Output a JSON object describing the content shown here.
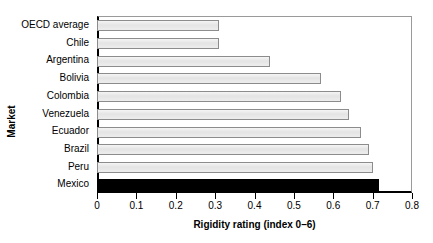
{
  "chart_data": {
    "type": "bar",
    "orientation": "horizontal",
    "title": "",
    "xlabel": "Rigidity rating (index 0–6)",
    "ylabel": "Market",
    "categories": [
      "OECD average",
      "Chile",
      "Argentina",
      "Bolivia",
      "Colombia",
      "Venezuela",
      "Ecuador",
      "Brazil",
      "Peru",
      "Mexico"
    ],
    "values": [
      0.31,
      0.31,
      0.44,
      0.57,
      0.62,
      0.64,
      0.67,
      0.69,
      0.7,
      0.715
    ],
    "xlim": [
      0,
      0.8
    ],
    "xticks": [
      0,
      0.1,
      0.2,
      0.3,
      0.4,
      0.5,
      0.6,
      0.7,
      0.8
    ],
    "xtick_labels": [
      "0",
      "0.1",
      "0.2",
      "0.3",
      "0.4",
      "0.5",
      "0.6",
      "0.7",
      "0.8"
    ],
    "grid": false,
    "legend": false,
    "highlight_category": "Mexico",
    "colors": {
      "bar_fill": "#e8e8e8",
      "bar_border": "#8c8c8c",
      "highlight_fill": "#000000",
      "axis": "#000000",
      "background": "#ffffff",
      "text": "#000000"
    }
  }
}
